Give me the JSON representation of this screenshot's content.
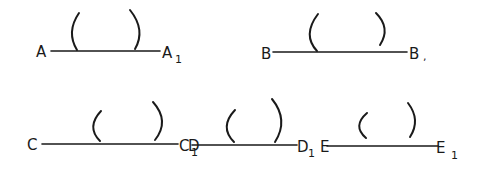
{
  "diagram": {
    "ink_color": "#1a1a1a",
    "background": "#ffffff",
    "segments": [
      {
        "name": "AA1",
        "start_label": "A",
        "end_label": "A",
        "end_subscript": "1",
        "line": {
          "x1": 51,
          "y1": 51,
          "x2": 160,
          "y2": 51
        },
        "start_label_pos": {
          "x": 36,
          "y": 57
        },
        "end_label_pos": {
          "x": 162,
          "y": 58
        },
        "end_sub_pos": {
          "x": 175,
          "y": 63
        },
        "left_arc": "M 79 13 Q 66 32 77 50",
        "right_arc": "M 130 10 Q 146 30 135 49"
      },
      {
        "name": "BB1",
        "start_label": "B",
        "end_label": "B",
        "end_subscript": ",",
        "line": {
          "x1": 273,
          "y1": 52,
          "x2": 407,
          "y2": 52
        },
        "start_label_pos": {
          "x": 261,
          "y": 59
        },
        "end_label_pos": {
          "x": 409,
          "y": 59
        },
        "end_sub_pos": {
          "x": 423,
          "y": 60
        },
        "left_arc": "M 318 14 Q 302 35 317 51",
        "right_arc": "M 376 13 Q 391 28 380 45"
      },
      {
        "name": "CC1",
        "start_label": "C",
        "end_label": "C",
        "end_subscript": "1",
        "line": {
          "x1": 42,
          "y1": 144,
          "x2": 178,
          "y2": 144
        },
        "start_label_pos": {
          "x": 27,
          "y": 150
        },
        "end_label_pos": {
          "x": 179,
          "y": 151
        },
        "end_sub_pos": {
          "x": 191,
          "y": 156
        },
        "left_arc": "M 101 111 Q 86 127 100 141",
        "right_arc": "M 153 102 Q 170 121 155 140"
      },
      {
        "name": "DD1",
        "start_label": "D",
        "end_label": "D",
        "end_subscript": "1",
        "line": {
          "x1": 192,
          "y1": 145,
          "x2": 297,
          "y2": 145
        },
        "start_label_pos": {
          "x": 188,
          "y": 151
        },
        "end_label_pos": {
          "x": 297,
          "y": 152
        },
        "end_sub_pos": {
          "x": 308,
          "y": 157
        },
        "left_arc": "M 235 110 Q 219 127 234 142",
        "right_arc": "M 272 99 Q 289 120 275 142"
      },
      {
        "name": "EE1",
        "start_label": "E",
        "end_label": "E",
        "end_subscript": "1",
        "line": {
          "x1": 327,
          "y1": 146,
          "x2": 438,
          "y2": 146
        },
        "start_label_pos": {
          "x": 320,
          "y": 152
        },
        "end_label_pos": {
          "x": 436,
          "y": 153
        },
        "end_sub_pos": {
          "x": 451,
          "y": 159
        },
        "left_arc": "M 367 113 Q 352 126 366 138",
        "right_arc": "M 408 103 Q 421 120 410 137"
      }
    ]
  }
}
